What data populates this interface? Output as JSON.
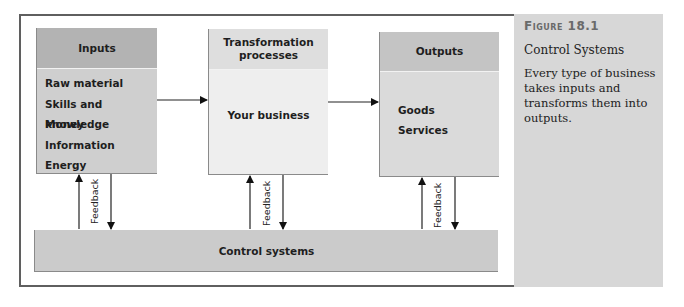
{
  "figure": {
    "label": "Figure 18.1",
    "title": "Control Systems",
    "caption": "Every type of business takes inputs and transforms them into outputs."
  },
  "diagram": {
    "inputs": {
      "header": "Inputs",
      "items": [
        "Raw material",
        "Skills and knowledge",
        "Money",
        "Information",
        "Energy"
      ]
    },
    "transformation": {
      "header": "Transformation processes",
      "body": "Your business"
    },
    "outputs": {
      "header": "Outputs",
      "items": [
        "Goods",
        "Services"
      ]
    },
    "control": {
      "label": "Control systems"
    },
    "feedback_label": "Feedback",
    "colors": {
      "frame_border": "#5f5f5f",
      "side_panel": "#d7d7d7",
      "inputs_header": "#b3b3b3",
      "inputs_body": "#cfcfcf",
      "transform_header": "#dedede",
      "transform_body": "#eeeeee",
      "outputs_header": "#c4c4c4",
      "outputs_body": "#dadada",
      "control_bar": "#cbcbcb"
    }
  }
}
